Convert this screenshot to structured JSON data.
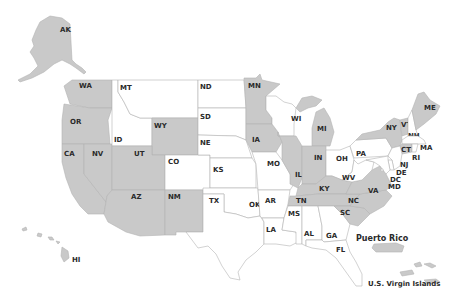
{
  "map": {
    "title": "US States and Territories Map",
    "colors": {
      "selected": "#c9c9c9",
      "unselected": "#ffffff",
      "border": "#b4b4b4",
      "label": "#2a2a2a"
    },
    "states": {
      "AK": {
        "label": "AK",
        "selected": true
      },
      "HI": {
        "label": "HI",
        "selected": true
      },
      "WA": {
        "label": "WA",
        "selected": true
      },
      "OR": {
        "label": "OR",
        "selected": true
      },
      "CA": {
        "label": "CA",
        "selected": true
      },
      "NV": {
        "label": "NV",
        "selected": true
      },
      "ID": {
        "label": "ID",
        "selected": false
      },
      "MT": {
        "label": "MT",
        "selected": false
      },
      "WY": {
        "label": "WY",
        "selected": true
      },
      "UT": {
        "label": "UT",
        "selected": true
      },
      "AZ": {
        "label": "AZ",
        "selected": true
      },
      "CO": {
        "label": "CO",
        "selected": false
      },
      "NM": {
        "label": "NM",
        "selected": true
      },
      "ND": {
        "label": "ND",
        "selected": false
      },
      "SD": {
        "label": "SD",
        "selected": false
      },
      "NE": {
        "label": "NE",
        "selected": false
      },
      "KS": {
        "label": "KS",
        "selected": false
      },
      "OK": {
        "label": "OK",
        "selected": false
      },
      "TX": {
        "label": "TX",
        "selected": false
      },
      "MN": {
        "label": "MN",
        "selected": true
      },
      "IA": {
        "label": "IA",
        "selected": true
      },
      "MO": {
        "label": "MO",
        "selected": false
      },
      "AR": {
        "label": "AR",
        "selected": false
      },
      "LA": {
        "label": "LA",
        "selected": false
      },
      "WI": {
        "label": "WI",
        "selected": false
      },
      "IL": {
        "label": "IL",
        "selected": true
      },
      "MI": {
        "label": "MI",
        "selected": true
      },
      "IN": {
        "label": "IN",
        "selected": true
      },
      "OH": {
        "label": "OH",
        "selected": false
      },
      "KY": {
        "label": "KY",
        "selected": true
      },
      "TN": {
        "label": "TN",
        "selected": true
      },
      "MS": {
        "label": "MS",
        "selected": false
      },
      "AL": {
        "label": "AL",
        "selected": false
      },
      "GA": {
        "label": "GA",
        "selected": false
      },
      "FL": {
        "label": "FL",
        "selected": false
      },
      "SC": {
        "label": "SC",
        "selected": true
      },
      "NC": {
        "label": "NC",
        "selected": true
      },
      "VA": {
        "label": "VA",
        "selected": true
      },
      "WV": {
        "label": "WV",
        "selected": false
      },
      "PA": {
        "label": "PA",
        "selected": false
      },
      "NY": {
        "label": "NY",
        "selected": true
      },
      "VT": {
        "label": "VT",
        "selected": true
      },
      "NH": {
        "label": "NH",
        "selected": false
      },
      "ME": {
        "label": "ME",
        "selected": true
      },
      "MA": {
        "label": "MA",
        "selected": false
      },
      "RI": {
        "label": "RI",
        "selected": false
      },
      "CT": {
        "label": "CT",
        "selected": true
      },
      "NJ": {
        "label": "NJ",
        "selected": false
      },
      "DE": {
        "label": "DE",
        "selected": false
      },
      "MD": {
        "label": "MD",
        "selected": false
      },
      "DC": {
        "label": "DC",
        "selected": false
      }
    },
    "territories": {
      "PR": {
        "label": "Puerto Rico",
        "selected": true
      },
      "VI": {
        "label": "U.S. Virgin Islands",
        "selected": true
      }
    }
  }
}
